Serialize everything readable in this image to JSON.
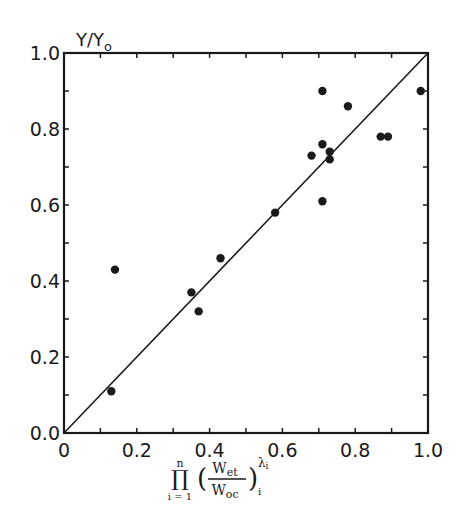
{
  "chart_data": {
    "type": "scatter",
    "title": "",
    "xlabel": "∏ (i=1..n) (W_et / W_oc)_i ^ λ_i",
    "ylabel": "Y/Y0",
    "xlim": [
      0.0,
      1.0
    ],
    "ylim": [
      0.0,
      1.0
    ],
    "x_ticks": [
      "0",
      "0.2",
      "0.4",
      "0.6",
      "0.8",
      "1.0"
    ],
    "y_ticks": [
      "0.0",
      "0.2",
      "0.4",
      "0.6",
      "0.8",
      "1.0"
    ],
    "grid": false,
    "legend": null,
    "reference_line": {
      "label": "y = x",
      "from": [
        0.0,
        0.0
      ],
      "to": [
        1.0,
        1.0
      ]
    },
    "series": [
      {
        "name": "observations",
        "points": [
          {
            "x": 0.13,
            "y": 0.11
          },
          {
            "x": 0.14,
            "y": 0.43
          },
          {
            "x": 0.35,
            "y": 0.37
          },
          {
            "x": 0.37,
            "y": 0.32
          },
          {
            "x": 0.43,
            "y": 0.46
          },
          {
            "x": 0.58,
            "y": 0.58
          },
          {
            "x": 0.68,
            "y": 0.73
          },
          {
            "x": 0.71,
            "y": 0.61
          },
          {
            "x": 0.71,
            "y": 0.76
          },
          {
            "x": 0.71,
            "y": 0.9
          },
          {
            "x": 0.73,
            "y": 0.74
          },
          {
            "x": 0.73,
            "y": 0.72
          },
          {
            "x": 0.78,
            "y": 0.86
          },
          {
            "x": 0.87,
            "y": 0.78
          },
          {
            "x": 0.89,
            "y": 0.78
          },
          {
            "x": 0.98,
            "y": 0.9
          }
        ]
      }
    ]
  },
  "labels": {
    "y_axis_main": "Y/Y",
    "y_axis_sub": "o",
    "x_axis_prod": "∏",
    "x_axis_prod_upper": "n",
    "x_axis_prod_lower": "i = 1",
    "x_axis_num": "W",
    "x_axis_num_sub": "et",
    "x_axis_den": "W",
    "x_axis_den_sub": "oc",
    "x_axis_exp": "λ",
    "x_axis_exp_sub": "i",
    "x_axis_outer_sub": "i"
  },
  "colors": {
    "ink": "#1a1a1a",
    "background": "#ffffff"
  }
}
